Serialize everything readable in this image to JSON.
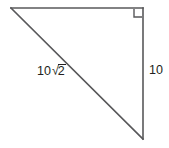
{
  "figure": {
    "type": "right-triangle-diagram",
    "canvas": {
      "width": 169,
      "height": 148,
      "background": "#ffffff"
    },
    "stroke_color": "#58585a",
    "text_color": "#231f20",
    "vertices": {
      "top_left": {
        "x": 11,
        "y": 8
      },
      "top_right": {
        "x": 143,
        "y": 8
      },
      "bottom_right": {
        "x": 143,
        "y": 139
      }
    },
    "right_angle": {
      "at_vertex": "top_right",
      "marker": "square",
      "size": 9
    },
    "labels": {
      "hypotenuse": {
        "coefficient": "10",
        "radical_symbol": "√",
        "radicand": "2",
        "full_text": "10√2"
      },
      "vertical_leg": "10"
    }
  }
}
